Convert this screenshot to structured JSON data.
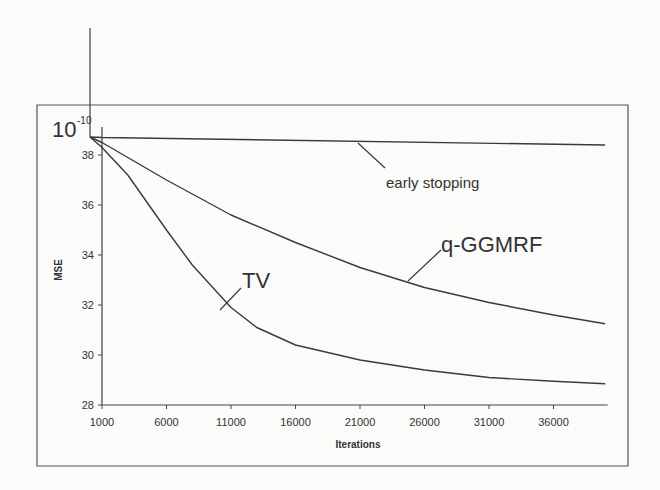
{
  "chart_data": {
    "type": "line",
    "title": "",
    "xlabel": "Iterations",
    "ylabel": "MSE",
    "y_multiplier": "10^-10",
    "y_multiplier_base": "10",
    "y_multiplier_exp": "-10",
    "xlim": [
      1000,
      40200
    ],
    "ylim": [
      28,
      38.8
    ],
    "x_ticks": [
      1000,
      6000,
      11000,
      16000,
      21000,
      26000,
      31000,
      36000
    ],
    "y_ticks": [
      28,
      30,
      32,
      34,
      36,
      38
    ],
    "grid": false,
    "legend": "inline annotations",
    "series": [
      {
        "name": "early stopping",
        "x": [
          1000,
          40000
        ],
        "values": [
          38.7,
          38.4
        ]
      },
      {
        "name": "q-GGMRF",
        "x": [
          1000,
          6000,
          11000,
          16000,
          21000,
          26000,
          31000,
          36000,
          40000
        ],
        "values": [
          38.5,
          37.0,
          35.6,
          34.5,
          33.5,
          32.7,
          32.1,
          31.6,
          31.25
        ]
      },
      {
        "name": "TV",
        "x": [
          1000,
          3000,
          6000,
          8000,
          11000,
          13000,
          16000,
          21000,
          26000,
          31000,
          36000,
          40000
        ],
        "values": [
          38.3,
          37.2,
          35.0,
          33.6,
          31.9,
          31.1,
          30.4,
          29.8,
          29.4,
          29.1,
          28.95,
          28.85
        ]
      }
    ],
    "annotations": [
      {
        "text": "early stopping",
        "target": "early stopping"
      },
      {
        "text": "q-GGMRF",
        "target": "q-GGMRF"
      },
      {
        "text": "TV",
        "target": "TV"
      }
    ]
  }
}
